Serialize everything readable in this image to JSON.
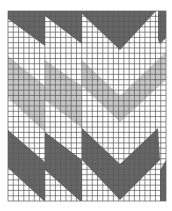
{
  "colors": {
    "background": "#ffffff",
    "light": "#c6c6c6",
    "dark": "#666666",
    "grid": "#5a5a5a"
  },
  "grid": {
    "columns": 30,
    "rows": 36
  },
  "pattern": {
    "description": "Herringbone/chevron pattern of dark, light-gray and white diagonal bands across three vertical panels",
    "panels": 3,
    "shades": [
      "white",
      "light-gray",
      "dark-gray"
    ]
  }
}
